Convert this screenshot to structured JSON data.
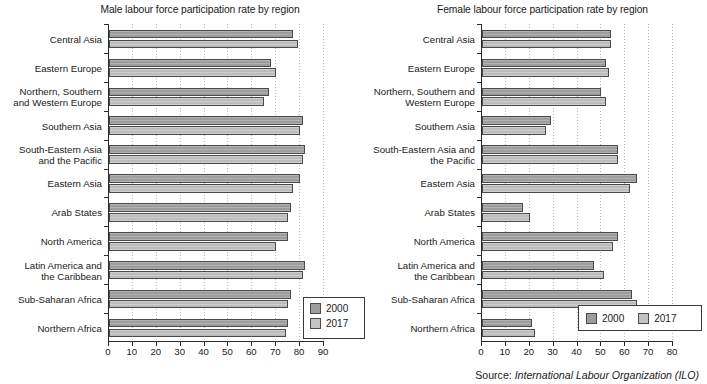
{
  "source": {
    "label": "Source:",
    "value": "International Labour Organization (ILO)"
  },
  "charts": [
    {
      "id": "male",
      "title": "Male labour force participation rate by region",
      "legend": {
        "orientation": "vertical",
        "items": [
          {
            "label": "2000",
            "color": "#9d9d9d"
          },
          {
            "label": "2017",
            "color": "#c3c3c3"
          }
        ]
      },
      "xaxis": {
        "min": 0,
        "max": 90,
        "step": 10,
        "ticks": [
          "0",
          "10",
          "20",
          "30",
          "40",
          "50",
          "60",
          "70",
          "80",
          "90"
        ]
      }
    },
    {
      "id": "female",
      "title": "Female labour force participation rate by region",
      "legend": {
        "orientation": "horizontal",
        "items": [
          {
            "label": "2000",
            "color": "#9d9d9d"
          },
          {
            "label": "2017",
            "color": "#c3c3c3"
          }
        ]
      },
      "xaxis": {
        "min": 0,
        "max": 80,
        "step": 10,
        "ticks": [
          "0",
          "10",
          "20",
          "30",
          "40",
          "50",
          "60",
          "70",
          "80"
        ]
      }
    }
  ],
  "chart_data": [
    {
      "type": "bar",
      "orientation": "horizontal",
      "title": "Male labour force participation rate by region",
      "xlabel": "",
      "ylabel": "",
      "xlim": [
        0,
        90
      ],
      "xticks": [
        0,
        10,
        20,
        30,
        40,
        50,
        60,
        70,
        80,
        90
      ],
      "grid": true,
      "legend_position": "bottom-right",
      "categories": [
        "Central Asia",
        "Eastern Europe",
        "Northern, Southern\nand Western Europe",
        "Southern Asia",
        "South-Eastern Asia\nand the Pacific",
        "Eastern Asia",
        "Arab States",
        "North America",
        "Latin America and\nthe Caribbean",
        "Sub-Saharan Africa",
        "Northern Africa"
      ],
      "series": [
        {
          "name": "2000",
          "color": "#9d9d9d",
          "values": [
            77,
            68,
            67,
            81,
            82,
            80,
            76,
            75,
            82,
            76,
            75
          ]
        },
        {
          "name": "2017",
          "color": "#c3c3c3",
          "values": [
            79,
            70,
            65,
            80,
            81,
            77,
            75,
            70,
            81,
            75,
            74
          ]
        }
      ]
    },
    {
      "type": "bar",
      "orientation": "horizontal",
      "title": "Female labour force participation rate by region",
      "xlabel": "",
      "ylabel": "",
      "xlim": [
        0,
        80
      ],
      "xticks": [
        0,
        10,
        20,
        30,
        40,
        50,
        60,
        70,
        80
      ],
      "grid": true,
      "legend_position": "bottom-right",
      "categories": [
        "Central Asia",
        "Eastern Europe",
        "Northern, Southern and\nWestern Europe",
        "Southern Asia",
        "South-Eastern Asia and\nthe Pacific",
        "Eastern Asia",
        "Arab States",
        "North America",
        "Latin America and\nthe Caribbean",
        "Sub-Saharan Africa",
        "Northern Africa"
      ],
      "series": [
        {
          "name": "2000",
          "color": "#9d9d9d",
          "values": [
            54,
            52,
            50,
            29,
            57,
            65,
            17,
            57,
            47,
            63,
            21
          ]
        },
        {
          "name": "2017",
          "color": "#c3c3c3",
          "values": [
            54,
            53,
            52,
            27,
            57,
            62,
            20,
            55,
            51,
            65,
            22
          ]
        }
      ]
    }
  ]
}
